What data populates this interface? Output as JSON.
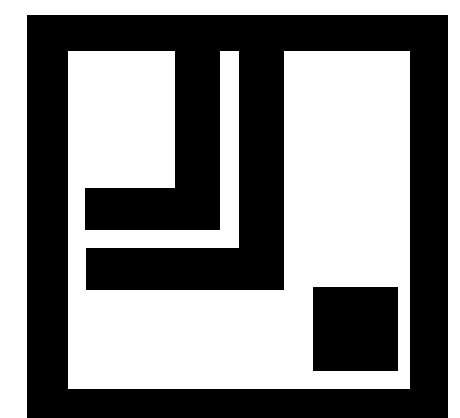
{
  "logo": {
    "description": "Abstract geometric mark: square black frame containing two nested L-shaped bars and a small black square",
    "colors": {
      "foreground": "#000000",
      "background": "#ffffff"
    }
  }
}
